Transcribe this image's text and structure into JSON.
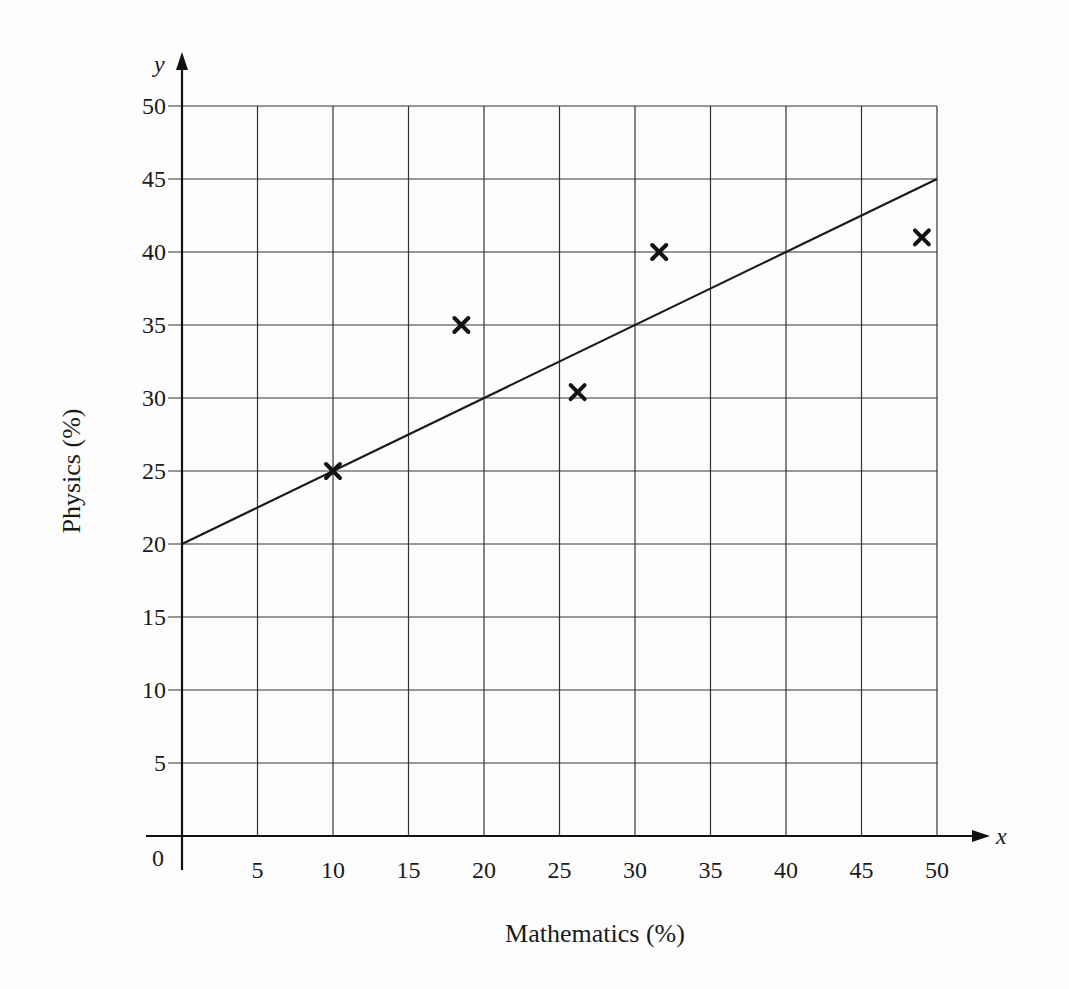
{
  "chart_data": {
    "type": "scatter",
    "title": "",
    "xlabel": "Mathematics (%)",
    "ylabel": "Physics (%)",
    "x_axis_var": "x",
    "y_axis_var": "y",
    "origin_label": "0",
    "xlim": [
      0,
      50
    ],
    "ylim": [
      0,
      50
    ],
    "grid": true,
    "x_ticks": [
      5,
      10,
      15,
      20,
      25,
      30,
      35,
      40,
      45,
      50
    ],
    "y_ticks": [
      5,
      10,
      15,
      20,
      25,
      30,
      35,
      40,
      45,
      50
    ],
    "series": [
      {
        "name": "data points",
        "marker": "x",
        "points": [
          {
            "x": 10,
            "y": 25
          },
          {
            "x": 18.5,
            "y": 35
          },
          {
            "x": 26.2,
            "y": 30.4
          },
          {
            "x": 31.6,
            "y": 40
          },
          {
            "x": 49,
            "y": 41
          }
        ]
      },
      {
        "name": "line of best fit",
        "type": "line",
        "points": [
          {
            "x": 0,
            "y": 20
          },
          {
            "x": 50,
            "y": 45
          }
        ]
      }
    ],
    "legend": null
  }
}
